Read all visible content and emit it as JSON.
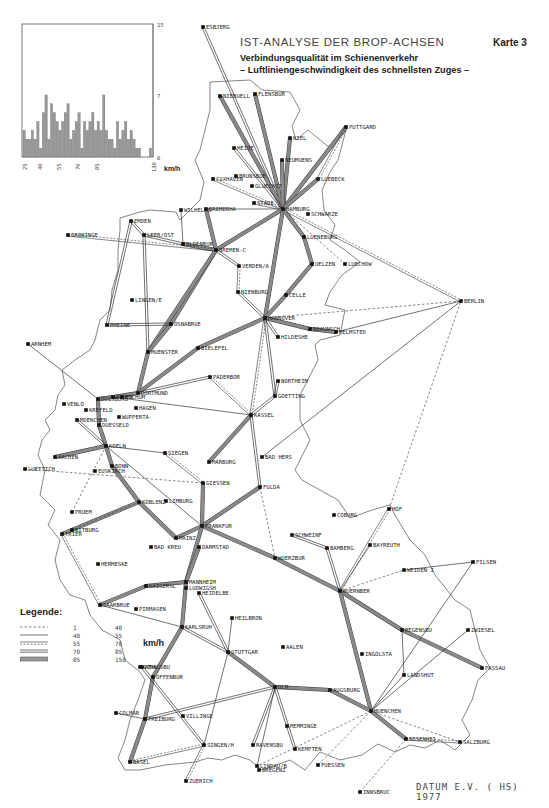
{
  "header": {
    "title": "IST-ANALYSE DER BROP-ACHSEN",
    "subtitle_line1": "Verbindungsqualität im Schienenverkehr",
    "subtitle_line2": "– Luftliniengeschwindigkeit des schnellsten Zuges –",
    "map_number": "Karte 3"
  },
  "footer": {
    "credit": "DATUM E.V. ( HS) 1977"
  },
  "legend": {
    "title": "Legende:",
    "unit": "km/h",
    "rows": [
      {
        "style": "dashed",
        "from": "1",
        "to": "40"
      },
      {
        "style": "single",
        "from": "40",
        "to": "55"
      },
      {
        "style": "double-dashed",
        "from": "55",
        "to": "70"
      },
      {
        "style": "double",
        "from": "70",
        "to": "85"
      },
      {
        "style": "thick",
        "from": "85",
        "to": "150"
      }
    ]
  },
  "chart_data": {
    "type": "bar",
    "title": "",
    "xlabel": "km/h",
    "ylabel": "",
    "x_ticks": [
      "25",
      "40",
      "55",
      "70",
      "85",
      "130"
    ],
    "y_ticks": [
      "0",
      "7",
      "15"
    ],
    "ylim": [
      0,
      15
    ],
    "xlim": [
      25,
      130
    ],
    "grid": false,
    "values": [
      3,
      2,
      2,
      3,
      2,
      4,
      1,
      5,
      7,
      2,
      6,
      5,
      4,
      3,
      4,
      5,
      6,
      2,
      3,
      4,
      5,
      1,
      4,
      3,
      4,
      5,
      3,
      4,
      3,
      7,
      3,
      2,
      2,
      1,
      4,
      2,
      3,
      4,
      2,
      3,
      2,
      1,
      1,
      0,
      0,
      0,
      1
    ]
  },
  "cities": [
    {
      "name": "ESBJERG",
      "x": 203,
      "y": 27
    },
    {
      "name": "NIEBUELL",
      "x": 220,
      "y": 96
    },
    {
      "name": "FLENSBUR",
      "x": 255,
      "y": 94
    },
    {
      "name": "HEIDE",
      "x": 234,
      "y": 148
    },
    {
      "name": "KIEL",
      "x": 290,
      "y": 138
    },
    {
      "name": "PUTTGARD",
      "x": 346,
      "y": 127
    },
    {
      "name": "NEUMUENS",
      "x": 282,
      "y": 160
    },
    {
      "name": "CUXHAVEN",
      "x": 213,
      "y": 179
    },
    {
      "name": "BRUNSBUE",
      "x": 236,
      "y": 176
    },
    {
      "name": "GLUECKST",
      "x": 252,
      "y": 186
    },
    {
      "name": "STADE",
      "x": 254,
      "y": 203
    },
    {
      "name": "LUEBECK",
      "x": 318,
      "y": 179
    },
    {
      "name": "BREMERHA",
      "x": 206,
      "y": 209
    },
    {
      "name": "HAMBURG",
      "x": 283,
      "y": 209
    },
    {
      "name": "SCHWARZE",
      "x": 308,
      "y": 214
    },
    {
      "name": "WILHELMS",
      "x": 181,
      "y": 210
    },
    {
      "name": "EMDEN",
      "x": 131,
      "y": 221
    },
    {
      "name": "GRONINGE",
      "x": 68,
      "y": 235
    },
    {
      "name": "LEER/OST",
      "x": 144,
      "y": 235
    },
    {
      "name": "OLDENBUR",
      "x": 183,
      "y": 244
    },
    {
      "name": "BREMEN-C",
      "x": 216,
      "y": 250
    },
    {
      "name": "LUENEBURG",
      "x": 304,
      "y": 237
    },
    {
      "name": "VERDEN/A",
      "x": 239,
      "y": 266
    },
    {
      "name": "UELZEN",
      "x": 312,
      "y": 264
    },
    {
      "name": "LUECHOW",
      "x": 345,
      "y": 264
    },
    {
      "name": "NIENBURG",
      "x": 238,
      "y": 292
    },
    {
      "name": "CELLE",
      "x": 286,
      "y": 295
    },
    {
      "name": "BERLIN",
      "x": 461,
      "y": 301
    },
    {
      "name": "LINGEN/E",
      "x": 132,
      "y": 300
    },
    {
      "name": "HANNOVER",
      "x": 265,
      "y": 318
    },
    {
      "name": "BRAUNSCH",
      "x": 310,
      "y": 329
    },
    {
      "name": "HELMSTED",
      "x": 336,
      "y": 332
    },
    {
      "name": "RHEINE",
      "x": 107,
      "y": 325
    },
    {
      "name": "OSNABRUE",
      "x": 171,
      "y": 324
    },
    {
      "name": "HILDESHE",
      "x": 278,
      "y": 337
    },
    {
      "name": "ARNHEM",
      "x": 28,
      "y": 344
    },
    {
      "name": "MUENSTER",
      "x": 148,
      "y": 352
    },
    {
      "name": "BIELEFEL",
      "x": 198,
      "y": 348
    },
    {
      "name": "PADERBOR",
      "x": 210,
      "y": 377
    },
    {
      "name": "NORTHEIM",
      "x": 278,
      "y": 381
    },
    {
      "name": "GOETTING",
      "x": 275,
      "y": 396
    },
    {
      "name": "DUISBURG",
      "x": 98,
      "y": 399
    },
    {
      "name": "ESSEN",
      "x": 113,
      "y": 397
    },
    {
      "name": "DORTMUND",
      "x": 138,
      "y": 393
    },
    {
      "name": "BOCHUM",
      "x": 122,
      "y": 397
    },
    {
      "name": "VENLO",
      "x": 64,
      "y": 404
    },
    {
      "name": "KREFELD",
      "x": 86,
      "y": 410
    },
    {
      "name": "HAGEN",
      "x": 136,
      "y": 408
    },
    {
      "name": "WUPPERTA",
      "x": 119,
      "y": 417
    },
    {
      "name": "MOENCHEN",
      "x": 77,
      "y": 420
    },
    {
      "name": "DUESSELD",
      "x": 99,
      "y": 425
    },
    {
      "name": "KASSEL",
      "x": 251,
      "y": 415
    },
    {
      "name": "KOELN",
      "x": 106,
      "y": 446
    },
    {
      "name": "AACHEN",
      "x": 55,
      "y": 457
    },
    {
      "name": "LUETTICH",
      "x": 25,
      "y": 469
    },
    {
      "name": "BONN",
      "x": 112,
      "y": 466
    },
    {
      "name": "EUSKIRCH",
      "x": 95,
      "y": 471
    },
    {
      "name": "SIEGEN",
      "x": 165,
      "y": 453
    },
    {
      "name": "BAD HERS",
      "x": 262,
      "y": 457
    },
    {
      "name": "MARBURG",
      "x": 209,
      "y": 462
    },
    {
      "name": "GIESSEN",
      "x": 203,
      "y": 483
    },
    {
      "name": "FULDA",
      "x": 260,
      "y": 487
    },
    {
      "name": "KOBLENZ",
      "x": 139,
      "y": 502
    },
    {
      "name": "LIMBURG",
      "x": 166,
      "y": 501
    },
    {
      "name": "PRUEM",
      "x": 72,
      "y": 512
    },
    {
      "name": "COBURG",
      "x": 334,
      "y": 515
    },
    {
      "name": "HOF",
      "x": 389,
      "y": 509
    },
    {
      "name": "BITBURG",
      "x": 72,
      "y": 530
    },
    {
      "name": "FRANKFUR",
      "x": 202,
      "y": 526
    },
    {
      "name": "SCHWEINF",
      "x": 292,
      "y": 535
    },
    {
      "name": "TRIER",
      "x": 62,
      "y": 534
    },
    {
      "name": "MAINZ",
      "x": 176,
      "y": 538
    },
    {
      "name": "BAMBERG",
      "x": 327,
      "y": 548
    },
    {
      "name": "BAYREUTH",
      "x": 370,
      "y": 545
    },
    {
      "name": "BAD KREU",
      "x": 151,
      "y": 547
    },
    {
      "name": "DARMSTAD",
      "x": 199,
      "y": 547
    },
    {
      "name": "WUERZBUR",
      "x": 275,
      "y": 558
    },
    {
      "name": "PILSEN",
      "x": 473,
      "y": 562
    },
    {
      "name": "HERMESKE",
      "x": 98,
      "y": 564
    },
    {
      "name": "WEIDEN I",
      "x": 404,
      "y": 570
    },
    {
      "name": "KAISERSL",
      "x": 146,
      "y": 586
    },
    {
      "name": "MANNHEIM",
      "x": 186,
      "y": 582
    },
    {
      "name": "LUDWIGSH",
      "x": 186,
      "y": 588
    },
    {
      "name": "HEIDELBE",
      "x": 199,
      "y": 593
    },
    {
      "name": "NUERNBER",
      "x": 340,
      "y": 591
    },
    {
      "name": "SAARBRUE",
      "x": 100,
      "y": 605
    },
    {
      "name": "PIRMASEN",
      "x": 136,
      "y": 609
    },
    {
      "name": "HEILBRON",
      "x": 232,
      "y": 618
    },
    {
      "name": "REGENSBU",
      "x": 402,
      "y": 630
    },
    {
      "name": "ZWIESEL",
      "x": 468,
      "y": 630
    },
    {
      "name": "KARLSRUH",
      "x": 182,
      "y": 627
    },
    {
      "name": "STUTTGAR",
      "x": 228,
      "y": 652
    },
    {
      "name": "AALEN",
      "x": 283,
      "y": 647
    },
    {
      "name": "INGOLSTA",
      "x": 362,
      "y": 654
    },
    {
      "name": "PASSAU",
      "x": 482,
      "y": 668
    },
    {
      "name": "LANDSHUT",
      "x": 404,
      "y": 675
    },
    {
      "name": "KEHL",
      "x": 142,
      "y": 667
    },
    {
      "name": "STRASSBU",
      "x": 140,
      "y": 667
    },
    {
      "name": "OFFENBUR",
      "x": 153,
      "y": 677
    },
    {
      "name": "ULM",
      "x": 275,
      "y": 687
    },
    {
      "name": "AUGSBURG",
      "x": 330,
      "y": 690
    },
    {
      "name": "COLMAR",
      "x": 116,
      "y": 713
    },
    {
      "name": "FREIBURG",
      "x": 145,
      "y": 719
    },
    {
      "name": "VILLINGE",
      "x": 183,
      "y": 716
    },
    {
      "name": "MUENCHEN",
      "x": 371,
      "y": 711
    },
    {
      "name": "MEMMINGE",
      "x": 287,
      "y": 726
    },
    {
      "name": "SINGEN/H",
      "x": 204,
      "y": 745
    },
    {
      "name": "RAVENSBU",
      "x": 253,
      "y": 745
    },
    {
      "name": "KEMPTEN",
      "x": 295,
      "y": 749
    },
    {
      "name": "ROSENHEI",
      "x": 406,
      "y": 739
    },
    {
      "name": "SALZBURG",
      "x": 460,
      "y": 742
    },
    {
      "name": "BASEL",
      "x": 130,
      "y": 762
    },
    {
      "name": "LINDAU/B",
      "x": 257,
      "y": 766
    },
    {
      "name": "BREGENZ",
      "x": 259,
      "y": 770
    },
    {
      "name": "FUESSEN",
      "x": 318,
      "y": 765
    },
    {
      "name": "ZUERICH",
      "x": 186,
      "y": 781
    },
    {
      "name": "INNSBRUC",
      "x": 360,
      "y": 792
    }
  ]
}
